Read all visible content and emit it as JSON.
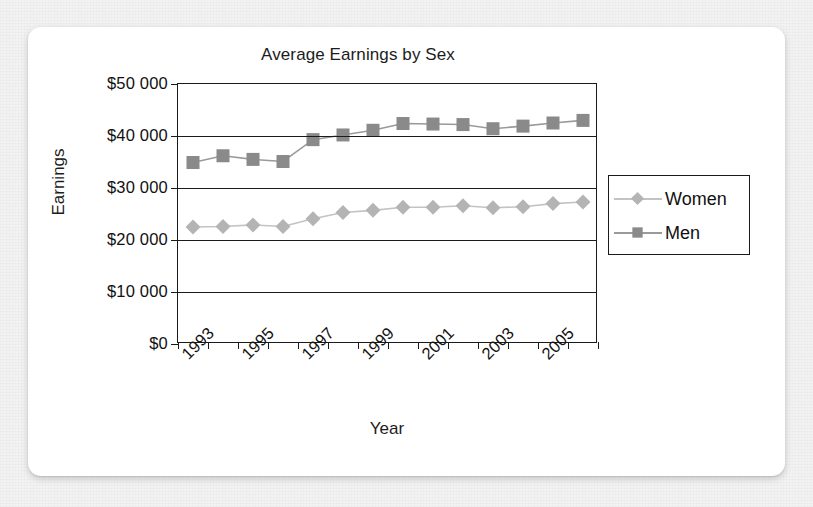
{
  "card": {
    "background_color": "#ffffff",
    "page_background_color": "#e8e8e8"
  },
  "chart_data": {
    "type": "line",
    "title": "Average Earnings by Sex",
    "xlabel": "Year",
    "ylabel": "Earnings",
    "grid": true,
    "legend_position": "right",
    "ylim": [
      0,
      50000
    ],
    "ytick_labels": [
      "$50 000",
      "$40 000",
      "$30 000",
      "$20 000",
      "$10 000",
      "$0"
    ],
    "ytick_values": [
      50000,
      40000,
      30000,
      20000,
      10000,
      0
    ],
    "categories": [
      1993,
      1994,
      1995,
      1996,
      1997,
      1998,
      1999,
      2000,
      2001,
      2002,
      2003,
      2004,
      2005,
      2006
    ],
    "xtick_labels": [
      "1993",
      "",
      "1995",
      "",
      "1997",
      "",
      "1999",
      "",
      "2001",
      "",
      "2003",
      "",
      "2005",
      ""
    ],
    "xtick_labels_shown": [
      "1993",
      "1995",
      "1997",
      "1999",
      "2001",
      "2003",
      "2005"
    ],
    "series": [
      {
        "name": "Women",
        "marker": "diamond",
        "color": "#b4b4b4",
        "line_color": "#c3c3c3",
        "values": [
          22500,
          22600,
          22900,
          22600,
          24100,
          25300,
          25700,
          26300,
          26300,
          26600,
          26200,
          26400,
          27000,
          27300
        ]
      },
      {
        "name": "Men",
        "marker": "square",
        "color": "#8a8a8a",
        "line_color": "#9a9a9a",
        "values": [
          34900,
          36200,
          35500,
          35100,
          39300,
          40200,
          41100,
          42400,
          42300,
          42200,
          41400,
          41900,
          42500,
          43000
        ]
      }
    ]
  },
  "legend": {
    "items": [
      {
        "label": "Women",
        "marker": "diamond-icon",
        "color": "#b4b4b4"
      },
      {
        "label": "Men",
        "marker": "square-icon",
        "color": "#8a8a8a"
      }
    ]
  }
}
